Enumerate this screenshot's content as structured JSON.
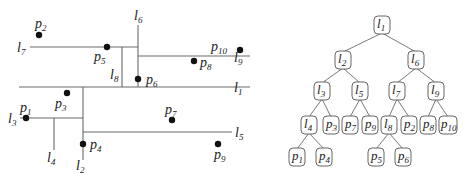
{
  "left_diagram": {
    "lines": [
      {
        "id": "l1",
        "name": "l",
        "sub": "1",
        "x1": 19,
        "y1": 87,
        "x2": 250,
        "y2": 87,
        "label_x": 234,
        "label_y": 92
      },
      {
        "id": "l2",
        "name": "l",
        "sub": "2",
        "x1": 83,
        "y1": 87,
        "x2": 83,
        "y2": 160,
        "label_x": 76,
        "label_y": 170
      },
      {
        "id": "l3",
        "name": "l",
        "sub": "3",
        "x1": 20,
        "y1": 118,
        "x2": 83,
        "y2": 118,
        "label_x": 8,
        "label_y": 123
      },
      {
        "id": "l4",
        "name": "l",
        "sub": "4",
        "x1": 54,
        "y1": 118,
        "x2": 54,
        "y2": 150,
        "label_x": 47,
        "label_y": 162
      },
      {
        "id": "l5",
        "name": "l",
        "sub": "5",
        "x1": 83,
        "y1": 132,
        "x2": 232,
        "y2": 132,
        "label_x": 235,
        "label_y": 137
      },
      {
        "id": "l6",
        "name": "l",
        "sub": "6",
        "x1": 138,
        "y1": 25,
        "x2": 138,
        "y2": 87,
        "label_x": 134,
        "label_y": 20
      },
      {
        "id": "l7",
        "name": "l",
        "sub": "7",
        "x1": 30,
        "y1": 47,
        "x2": 138,
        "y2": 47,
        "label_x": 17,
        "label_y": 52
      },
      {
        "id": "l8",
        "name": "l",
        "sub": "8",
        "x1": 122,
        "y1": 47,
        "x2": 122,
        "y2": 87,
        "label_x": 110,
        "label_y": 79
      },
      {
        "id": "l9",
        "name": "l",
        "sub": "9",
        "x1": 138,
        "y1": 56,
        "x2": 250,
        "y2": 56,
        "label_x": 234,
        "label_y": 62
      }
    ],
    "points": [
      {
        "id": "p1",
        "name": "p",
        "sub": "1",
        "x": 26,
        "y": 118,
        "label_x": 20,
        "label_y": 112
      },
      {
        "id": "p2",
        "name": "p",
        "sub": "2",
        "x": 39,
        "y": 35,
        "label_x": 35,
        "label_y": 28
      },
      {
        "id": "p3",
        "name": "p",
        "sub": "3",
        "x": 67,
        "y": 93,
        "label_x": 55,
        "label_y": 108
      },
      {
        "id": "p4",
        "name": "p",
        "sub": "4",
        "x": 83,
        "y": 144,
        "label_x": 90,
        "label_y": 149
      },
      {
        "id": "p5",
        "name": "p",
        "sub": "5",
        "x": 107,
        "y": 47,
        "label_x": 94,
        "label_y": 61
      },
      {
        "id": "p6",
        "name": "p",
        "sub": "6",
        "x": 138,
        "y": 79,
        "label_x": 146,
        "label_y": 84
      },
      {
        "id": "p7",
        "name": "p",
        "sub": "7",
        "x": 172,
        "y": 120,
        "label_x": 165,
        "label_y": 114
      },
      {
        "id": "p8",
        "name": "p",
        "sub": "8",
        "x": 194,
        "y": 61,
        "label_x": 200,
        "label_y": 67
      },
      {
        "id": "p9",
        "name": "p",
        "sub": "9",
        "x": 218,
        "y": 144,
        "label_x": 214,
        "label_y": 159
      },
      {
        "id": "p10",
        "name": "p",
        "sub": "10",
        "x": 240,
        "y": 50,
        "label_x": 211,
        "label_y": 51
      }
    ]
  },
  "tree": {
    "nodes": [
      {
        "id": "l1",
        "name": "l",
        "sub": "1",
        "x": 382,
        "y": 25
      },
      {
        "id": "l2",
        "name": "l",
        "sub": "2",
        "x": 343,
        "y": 60
      },
      {
        "id": "l6",
        "name": "l",
        "sub": "6",
        "x": 416,
        "y": 60
      },
      {
        "id": "l3",
        "name": "l",
        "sub": "3",
        "x": 322,
        "y": 91
      },
      {
        "id": "l5",
        "name": "l",
        "sub": "5",
        "x": 360,
        "y": 91
      },
      {
        "id": "l7",
        "name": "l",
        "sub": "7",
        "x": 397,
        "y": 91
      },
      {
        "id": "l9",
        "name": "l",
        "sub": "9",
        "x": 436,
        "y": 91
      },
      {
        "id": "l4",
        "name": "l",
        "sub": "4",
        "x": 309,
        "y": 125
      },
      {
        "id": "p3",
        "name": "p",
        "sub": "3",
        "x": 331,
        "y": 125
      },
      {
        "id": "p7",
        "name": "p",
        "sub": "7",
        "x": 350,
        "y": 125
      },
      {
        "id": "p9",
        "name": "p",
        "sub": "9",
        "x": 370,
        "y": 125
      },
      {
        "id": "l8",
        "name": "l",
        "sub": "8",
        "x": 389,
        "y": 125
      },
      {
        "id": "p2",
        "name": "p",
        "sub": "2",
        "x": 409,
        "y": 125
      },
      {
        "id": "p8",
        "name": "p",
        "sub": "8",
        "x": 428,
        "y": 125
      },
      {
        "id": "p10",
        "name": "p",
        "sub": "10",
        "x": 448,
        "y": 125
      },
      {
        "id": "p1",
        "name": "p",
        "sub": "1",
        "x": 297,
        "y": 157
      },
      {
        "id": "p4",
        "name": "p",
        "sub": "4",
        "x": 324,
        "y": 157
      },
      {
        "id": "p5",
        "name": "p",
        "sub": "5",
        "x": 376,
        "y": 157
      },
      {
        "id": "p6",
        "name": "p",
        "sub": "6",
        "x": 403,
        "y": 157
      }
    ],
    "edges": [
      [
        "l1",
        "l2"
      ],
      [
        "l1",
        "l6"
      ],
      [
        "l2",
        "l3"
      ],
      [
        "l2",
        "l5"
      ],
      [
        "l6",
        "l7"
      ],
      [
        "l6",
        "l9"
      ],
      [
        "l3",
        "l4"
      ],
      [
        "l3",
        "p3"
      ],
      [
        "l5",
        "p7"
      ],
      [
        "l5",
        "p9"
      ],
      [
        "l7",
        "l8"
      ],
      [
        "l7",
        "p2"
      ],
      [
        "l9",
        "p8"
      ],
      [
        "l9",
        "p10"
      ],
      [
        "l4",
        "p1"
      ],
      [
        "l4",
        "p4"
      ],
      [
        "l8",
        "p5"
      ],
      [
        "l8",
        "p6"
      ]
    ]
  },
  "colors": {
    "line": "#6a6a6a",
    "point": "#111111",
    "text": "#222222",
    "node_border": "#555555"
  }
}
